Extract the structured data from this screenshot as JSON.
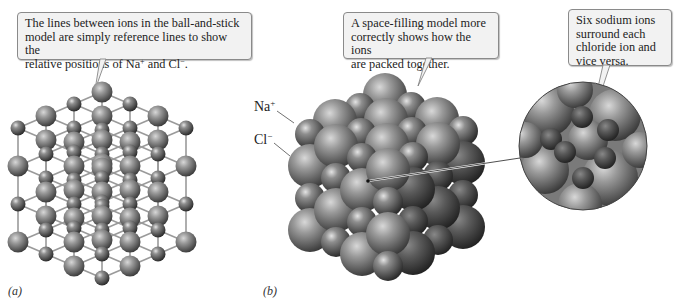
{
  "figure": {
    "panels": [
      {
        "id": "a",
        "label": "(a)",
        "model": "ball-and-stick",
        "callout": {
          "line1": "The lines between ions in the ball-and-stick",
          "line2": "model are simply reference lines to show the",
          "line3_prefix": "relative positions of Na",
          "line3_sup1": "+",
          "line3_mid": " and Cl",
          "line3_sup2": "−",
          "line3_suffix": "."
        }
      },
      {
        "id": "b",
        "label": "(b)",
        "model": "space-filling",
        "callout": {
          "line1": "A space-filling model more",
          "line2": "correctly shows how the ions",
          "line3": "are packed together."
        },
        "ion_labels": {
          "sodium_base": "Na",
          "sodium_charge": "+",
          "chloride_base": "Cl",
          "chloride_charge": "−"
        },
        "magnified_callout": {
          "line1": "Six sodium ions",
          "line2": "surround each",
          "line3": "chloride ion and",
          "line4": "vice versa."
        }
      }
    ],
    "colors": {
      "callout_bg": "#f2f2f2",
      "callout_border": "#8a8a8a",
      "sphere_light": "#a8a8a8",
      "sphere_dark": "#3c3c3c",
      "stick": "#9a9a9a"
    }
  }
}
